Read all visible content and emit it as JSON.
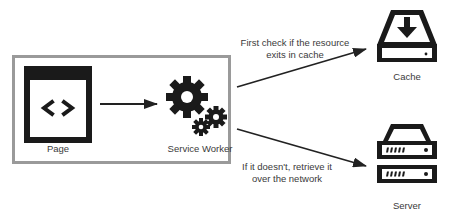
{
  "diagram": {
    "container": {
      "name": "client-boundary",
      "border_color": "#9a9a9a"
    },
    "nodes": [
      {
        "id": "page",
        "label": "Page",
        "icon": "code-window-icon"
      },
      {
        "id": "service_worker",
        "label": "Service Worker",
        "icon": "gears-icon"
      },
      {
        "id": "cache",
        "label": "Cache",
        "icon": "download-drive-icon"
      },
      {
        "id": "server",
        "label": "Server",
        "icon": "server-rack-icon"
      }
    ],
    "edges": [
      {
        "from": "page",
        "to": "service_worker",
        "label": ""
      },
      {
        "from": "service_worker",
        "to": "cache",
        "label_lines": [
          "First check if the resource",
          "exits in cache"
        ]
      },
      {
        "from": "service_worker",
        "to": "server",
        "label_lines": [
          "If it doesn't, retrieve it",
          "over the network"
        ]
      }
    ],
    "colors": {
      "icon": "#1a1a1a",
      "line": "#222222",
      "text": "#3a3a3a",
      "box_border": "#9a9a9a",
      "background": "#ffffff"
    }
  }
}
